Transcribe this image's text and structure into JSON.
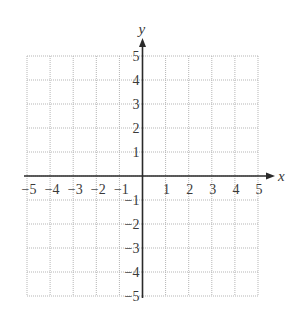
{
  "chart_data": {
    "type": "scatter",
    "title": "",
    "xlabel": "x",
    "ylabel": "y",
    "xlim": [
      -5,
      5
    ],
    "ylim": [
      -5,
      5
    ],
    "grid": true,
    "grid_style": "dotted",
    "x_ticks": [
      -5,
      -4,
      -3,
      -2,
      -1,
      1,
      2,
      3,
      4,
      5
    ],
    "y_ticks": [
      -5,
      -4,
      -3,
      -2,
      -1,
      1,
      2,
      3,
      4,
      5
    ],
    "x_tick_labels": [
      "−5",
      "−4",
      "−3",
      "−2",
      "−1",
      "1",
      "2",
      "3",
      "4",
      "5"
    ],
    "y_tick_labels": [
      "−5",
      "−4",
      "−3",
      "−2",
      "−1",
      "1",
      "2",
      "3",
      "4",
      "5"
    ],
    "series": [],
    "legend": null
  },
  "colors": {
    "axis": "#2a2a2a",
    "grid": "#b5b5b5",
    "text": "#3a3a3a",
    "background": "#ffffff"
  }
}
